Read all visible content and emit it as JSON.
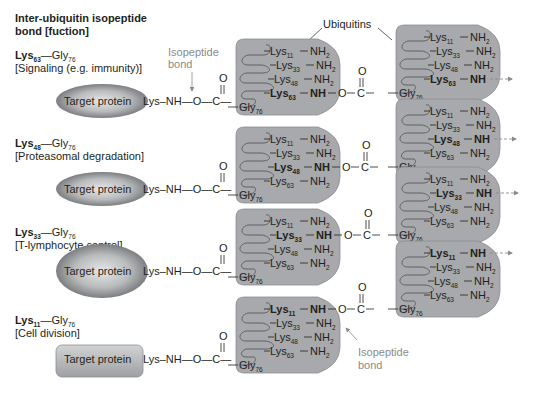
{
  "title": [
    "Inter-ubiquitin isopeptide",
    "bond [fuction]"
  ],
  "ubiquitins_label": "Ubiquitins",
  "isopeptide_label": [
    "Isopeptide",
    "bond"
  ],
  "target_label": "Target protein",
  "linker": {
    "lysnh": "Lys–NH—O—C—",
    "o": "O",
    "gly": "Gly",
    "gly_sub": "76"
  },
  "rows": [
    {
      "linkage": {
        "lys": "Lys",
        "lys_sub": "63",
        "gly": "—Gly",
        "gly_sub": "76"
      },
      "function": "[Signaling (e.g. immunity)]",
      "linked_residue": "63",
      "target_shape": "ellipse-wide"
    },
    {
      "linkage": {
        "lys": "Lys",
        "lys_sub": "48",
        "gly": "—Gly",
        "gly_sub": "76"
      },
      "function": "[Proteasomal degradation]",
      "linked_residue": "48",
      "target_shape": "ellipse-wide"
    },
    {
      "linkage": {
        "lys": "Lys",
        "lys_sub": "33",
        "gly": "—Gly",
        "gly_sub": "76"
      },
      "function": "[T-lymphocyte control]",
      "linked_residue": "33",
      "target_shape": "ellipse-round"
    },
    {
      "linkage": {
        "lys": "Lys",
        "lys_sub": "11",
        "gly": "—Gly",
        "gly_sub": "76"
      },
      "function": "[Cell division]",
      "linked_residue": "11",
      "target_shape": "rounded-rect"
    }
  ],
  "residues": [
    "11",
    "33",
    "48",
    "63"
  ],
  "residue_text": {
    "lys": "Lys",
    "nh2": "NH",
    "nh2_sub": "2",
    "nh": "NH"
  },
  "colors": {
    "ubiquitin_fill": "#a7a9ac",
    "ubiquitin_stroke": "#8c8e90",
    "text": "#231f20",
    "annotation": "#8a8a8a"
  }
}
